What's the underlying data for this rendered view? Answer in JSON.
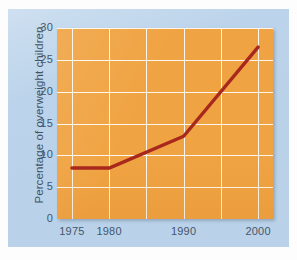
{
  "figure": {
    "panel_color": "#b9d2ea",
    "plot_background_color": "#f0a342",
    "grid_color": "#fdf6ec",
    "line_color": "#a8281e",
    "tick_text_color": "#44566b"
  },
  "chart_data": {
    "type": "line",
    "title": "",
    "xlabel": "",
    "ylabel": "Percentage of overweight children",
    "x": [
      1975,
      1980,
      1990,
      2000
    ],
    "values": [
      8,
      8,
      13,
      27
    ],
    "series": [
      {
        "name": "Percentage of overweight children",
        "color": "#a8281e",
        "values": [
          8,
          8,
          13,
          27
        ]
      }
    ],
    "xlim": [
      1973,
      2002
    ],
    "ylim": [
      0,
      30
    ],
    "xticks": [
      1975,
      1980,
      1990,
      2000
    ],
    "xtick_labels": [
      "1975",
      "1980",
      "1990",
      "2000"
    ],
    "yticks": [
      0,
      5,
      10,
      15,
      20,
      25,
      30
    ],
    "ytick_labels": [
      "0",
      "5",
      "10",
      "15",
      "20",
      "25",
      "30"
    ],
    "grid": true,
    "legend": false,
    "legend_position": "none"
  }
}
